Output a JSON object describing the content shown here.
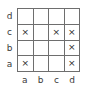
{
  "figure": {
    "type": "grid-diagram",
    "rows": 4,
    "cols": 4,
    "mark_glyph": "×",
    "line_color": "#6e6e6e",
    "text_color": "#3a3a3a",
    "mark_color": "#2b2b2b",
    "background": "#ffffff"
  },
  "row_labels": [
    "d",
    "c",
    "b",
    "a"
  ],
  "col_labels": [
    "a",
    "b",
    "c",
    "d"
  ],
  "cells": [
    [
      {
        "mark": ""
      },
      {
        "mark": ""
      },
      {
        "mark": ""
      },
      {
        "mark": ""
      }
    ],
    [
      {
        "mark": "×"
      },
      {
        "mark": ""
      },
      {
        "mark": "×"
      },
      {
        "mark": "×"
      }
    ],
    [
      {
        "mark": ""
      },
      {
        "mark": ""
      },
      {
        "mark": ""
      },
      {
        "mark": "×"
      }
    ],
    [
      {
        "mark": "×"
      },
      {
        "mark": ""
      },
      {
        "mark": ""
      },
      {
        "mark": "×"
      }
    ]
  ]
}
